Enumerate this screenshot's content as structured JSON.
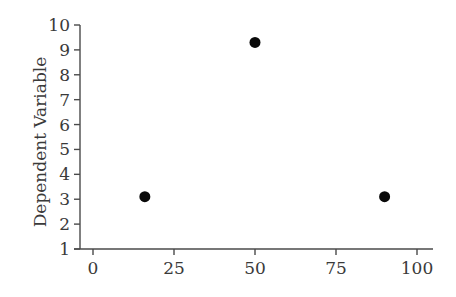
{
  "chart_data": {
    "type": "scatter",
    "title": "",
    "xlabel": "",
    "ylabel": "Dependent Variable",
    "xlim": [
      0,
      100
    ],
    "ylim": [
      1,
      10
    ],
    "x_ticks": [
      0,
      25,
      50,
      75,
      100
    ],
    "y_ticks": [
      1,
      2,
      3,
      4,
      5,
      6,
      7,
      8,
      9,
      10
    ],
    "grid": false,
    "legend": null,
    "series": [
      {
        "name": "points",
        "color": "#0a0a0a",
        "points": [
          {
            "x": 16,
            "y": 3.1
          },
          {
            "x": 50,
            "y": 9.3
          },
          {
            "x": 90,
            "y": 3.1
          }
        ]
      }
    ]
  },
  "layout": {
    "plot_left": 80,
    "plot_right": 433,
    "plot_top": 25,
    "plot_bottom": 249,
    "x0_px": 93,
    "x100_px": 417,
    "point_radius": 5.5
  }
}
